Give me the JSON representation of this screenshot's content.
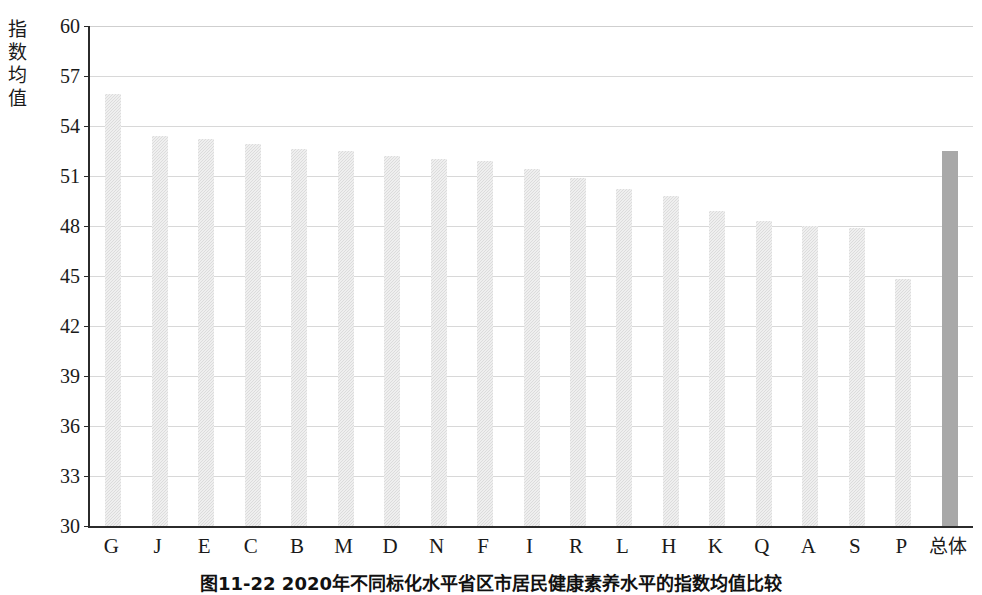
{
  "figure": {
    "caption": "图11-22  2020年不同标化水平省区市居民健康素养水平的指数均值比较"
  },
  "chart_data": {
    "type": "bar",
    "title": "",
    "xlabel": "",
    "ylabel": "指数均值",
    "ylim": [
      30,
      60
    ],
    "ytick_step": 3,
    "ytick_labels": [
      "60",
      "57",
      "54",
      "51",
      "48",
      "45",
      "42",
      "39",
      "36",
      "33",
      "30"
    ],
    "grid": true,
    "legend": "none",
    "categories": [
      "G",
      "J",
      "E",
      "C",
      "B",
      "M",
      "D",
      "N",
      "F",
      "I",
      "R",
      "L",
      "H",
      "K",
      "Q",
      "A",
      "S",
      "P",
      "总体"
    ],
    "values": [
      55.9,
      53.4,
      53.2,
      52.9,
      52.6,
      52.5,
      52.2,
      52.0,
      51.9,
      51.4,
      50.9,
      50.2,
      49.8,
      48.9,
      48.3,
      48.0,
      47.9,
      44.8,
      52.5
    ],
    "bar_colors": [
      "#dcdcdc",
      "#dcdcdc",
      "#dcdcdc",
      "#dcdcdc",
      "#dcdcdc",
      "#dcdcdc",
      "#dcdcdc",
      "#dcdcdc",
      "#dcdcdc",
      "#dcdcdc",
      "#dcdcdc",
      "#dcdcdc",
      "#dcdcdc",
      "#dcdcdc",
      "#dcdcdc",
      "#dcdcdc",
      "#dcdcdc",
      "#dcdcdc",
      "#a8a8a8"
    ],
    "highlight_category": "总体",
    "highlight_color": "#a8a8a8",
    "series_color": "#dcdcdc",
    "axis_color": "#2b2b2b",
    "grid_color": "#d8d8d8"
  }
}
